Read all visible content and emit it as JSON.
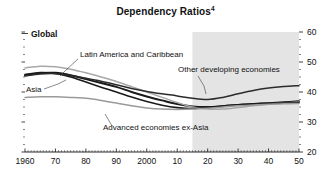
{
  "chart_data": {
    "type": "line",
    "title": "Dependency Ratios",
    "title_superscript": "4",
    "panel_label": "Global",
    "xlabel": "",
    "ylabel": "",
    "xlim": [
      1960,
      2050
    ],
    "ylim": [
      20,
      60
    ],
    "x_tick_labels": [
      "1960",
      "70",
      "80",
      "90",
      "2000",
      "10",
      "20",
      "30",
      "40",
      "50"
    ],
    "x_tick_values": [
      1960,
      1970,
      1980,
      1990,
      2000,
      2010,
      2020,
      2030,
      2040,
      2050
    ],
    "y_tick_labels": [
      "60",
      "50",
      "40",
      "30",
      "20"
    ],
    "y_tick_values": [
      60,
      50,
      40,
      30,
      20
    ],
    "y_axis_position": "right",
    "grid": false,
    "legend": "inline-annotations",
    "projection_start": 2015,
    "projection_shading_color": "#e4e4e4",
    "x": [
      1960,
      1965,
      1970,
      1975,
      1980,
      1985,
      1990,
      1995,
      2000,
      2005,
      2010,
      2015,
      2020,
      2025,
      2030,
      2035,
      2040,
      2045,
      2050
    ],
    "series": [
      {
        "name": "Global",
        "color": "#1a1a1a",
        "width": 1.9,
        "values": [
          45.5,
          46.3,
          46.4,
          45.6,
          44.3,
          43.0,
          41.7,
          40.0,
          38.5,
          37.2,
          36.0,
          35.2,
          35.0,
          35.3,
          35.7,
          36.0,
          36.3,
          36.6,
          36.9
        ]
      },
      {
        "name": "Latin America and Caribbean",
        "color": "#a8a8a8",
        "width": 1.5,
        "values": [
          48.0,
          48.6,
          48.4,
          47.6,
          46.4,
          45.0,
          43.5,
          41.8,
          40.0,
          38.2,
          36.5,
          35.0,
          34.3,
          34.3,
          34.8,
          35.4,
          35.9,
          36.3,
          36.6
        ]
      },
      {
        "name": "Asia",
        "color": "#1a1a1a",
        "width": 1.6,
        "values": [
          45.8,
          46.5,
          46.2,
          45.0,
          43.3,
          41.6,
          40.0,
          38.3,
          36.8,
          35.6,
          34.8,
          34.5,
          34.8,
          35.3,
          35.7,
          36.0,
          36.2,
          36.3,
          36.4
        ]
      },
      {
        "name": "Other developing economies",
        "color": "#2b2b2b",
        "width": 1.5,
        "values": [
          45.4,
          46.0,
          46.1,
          45.5,
          44.6,
          43.6,
          42.4,
          41.2,
          40.2,
          39.4,
          38.7,
          37.9,
          37.5,
          38.2,
          39.4,
          40.5,
          41.3,
          41.8,
          42.1
        ]
      },
      {
        "name": "Advanced economies ex-Asia",
        "color": "#9a9a9a",
        "width": 1.5,
        "values": [
          38.2,
          38.4,
          38.4,
          38.2,
          37.9,
          37.2,
          36.3,
          35.4,
          34.7,
          34.3,
          34.2,
          34.3,
          34.6,
          35.0,
          35.4,
          35.7,
          35.9,
          36.1,
          36.2
        ]
      }
    ],
    "annotations": [
      {
        "text": "Latin America and Caribbean",
        "x_px": 80,
        "y_px": 57,
        "anchor": "start",
        "leader": [
          [
            78,
            59
          ],
          [
            66,
            70
          ],
          [
            60,
            76
          ]
        ]
      },
      {
        "text": "Other developing economies",
        "x_px": 178,
        "y_px": 72,
        "anchor": "start",
        "leader": [
          [
            198,
            76
          ],
          [
            204,
            86
          ],
          [
            206,
            94
          ]
        ]
      },
      {
        "text": "Asia",
        "x_px": 26,
        "y_px": 92,
        "anchor": "start",
        "leader": [
          [
            44,
            89
          ],
          [
            58,
            84
          ],
          [
            66,
            80
          ]
        ]
      },
      {
        "text": "Advanced economies ex-Asia",
        "x_px": 103,
        "y_px": 130,
        "anchor": "start",
        "leader": [
          [
            112,
            126
          ],
          [
            108,
            119
          ],
          [
            105,
            114
          ]
        ]
      }
    ]
  }
}
